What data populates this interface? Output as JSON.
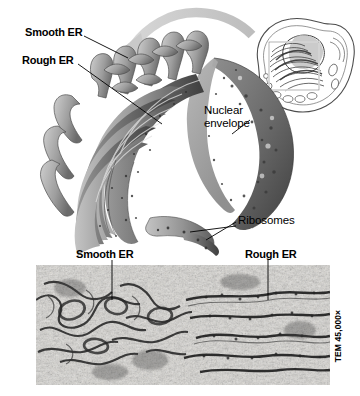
{
  "figure": {
    "background_color": "#ffffff"
  },
  "illustration": {
    "name": "er-cutaway-illustration",
    "labels": {
      "smooth_er": "Smooth ER",
      "rough_er": "Rough ER",
      "nuclear_envelope": "Nuclear\nenvelope",
      "ribosomes": "Ribosomes"
    },
    "colors": {
      "membrane_dark": "#4a4a4a",
      "membrane_mid": "#8d8d8d",
      "membrane_light": "#c2c2c2",
      "ribosome_dot": "#3b3b3b",
      "arrow": "#c9c9c9",
      "outline": "#2b2b2b"
    }
  },
  "inset_cell": {
    "name": "cell-overview-inset",
    "callout_box": "magnified region",
    "colors": {
      "line": "#4d4d4d",
      "fill": "#ffffff",
      "nucleus_shade": "#b9b9b9"
    }
  },
  "micrograph": {
    "name": "tem-micrograph",
    "labels": {
      "smooth_er": "Smooth ER",
      "rough_er": "Rough ER"
    },
    "magnification": "TEM 45,000×",
    "colors": {
      "base": "#d9d6cf",
      "membrane": "#141414"
    }
  }
}
